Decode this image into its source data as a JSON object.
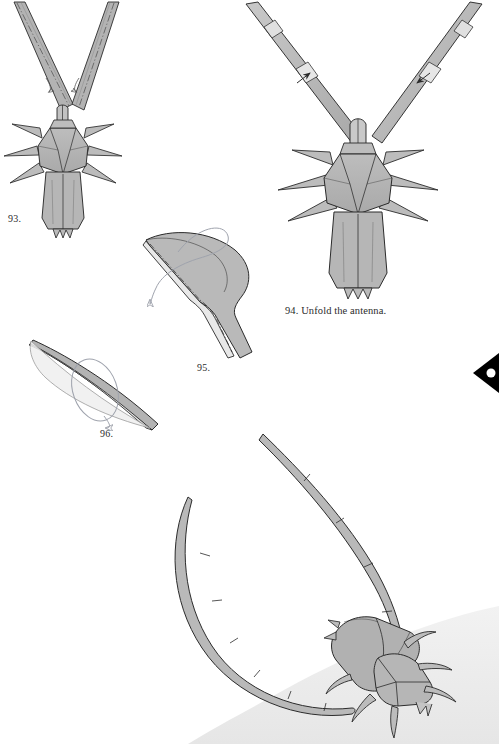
{
  "page": {
    "width": 499,
    "height": 744,
    "background": "#ffffff"
  },
  "colors": {
    "paper_front": "#b3b3b3",
    "paper_back": "#e4e4e4",
    "paper_mid": "#c6c6c6",
    "paper_shadow": "#9a9a9a",
    "outline": "#2b2b2b",
    "crease": "#3a3a3a",
    "arrow": "#2b2b2b",
    "rotation_arrow": "#9fa3ad",
    "ground_shade": "#ebebeb",
    "text": "#2b2b2b",
    "edge_marker": "#000000"
  },
  "figures": [
    {
      "id": "step-93",
      "label": "93.",
      "caption": "",
      "label_x": 8,
      "label_y": 219,
      "description": "beetle seen from above with two folded antennae raised in a V, showing dash-dot crease lines and two small unfold arrows"
    },
    {
      "id": "step-94",
      "label": "94.",
      "caption": "94. Unfold the antenna.",
      "label_x": 285,
      "label_y": 305,
      "description": "beetle from above with antennae unfolded and widened, two outward arrows on the antennae"
    },
    {
      "id": "step-95",
      "label": "95.",
      "caption": "",
      "label_x": 197,
      "label_y": 362,
      "description": "close-up of a curved antenna segment being shaped, with a looping rotation arrow"
    },
    {
      "id": "step-96",
      "label": "96.",
      "caption": "",
      "label_x": 100,
      "label_y": 428,
      "description": "narrow tapered antenna shape with a looping rotation arrow"
    },
    {
      "id": "finished-model",
      "label": "",
      "caption": "",
      "label_x": 0,
      "label_y": 0,
      "description": "completed origami longhorn beetle in three-quarter view with two very long curved segmented antennae sweeping forward, standing on a shaded ground"
    }
  ],
  "markers": [
    {
      "name": "page-edge-arrow",
      "shape": "left-pointing black diamond arrow bleeding off the right page edge",
      "x": 469,
      "y": 353
    }
  ]
}
